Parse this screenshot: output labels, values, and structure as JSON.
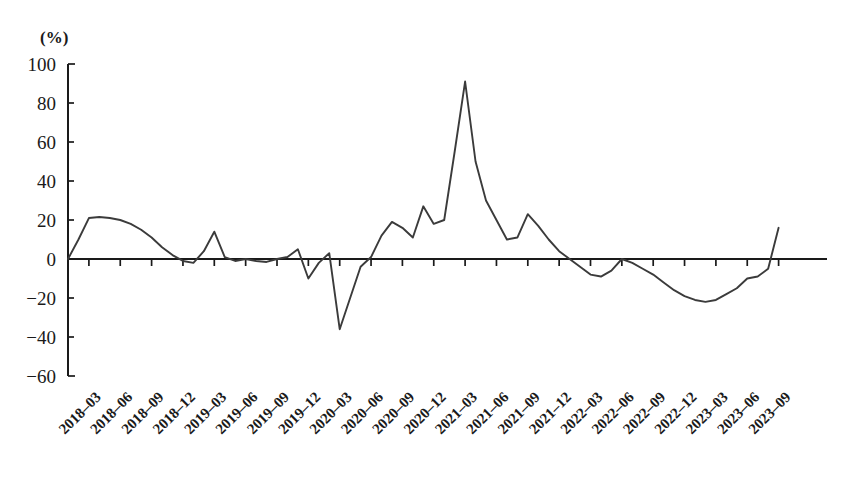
{
  "chart_data": {
    "type": "line",
    "title": "",
    "subtitle": "",
    "xlabel": "",
    "ylabel": "",
    "unit_label": "(%)",
    "ylim": [
      -60,
      100
    ],
    "ytick_values": [
      100,
      80,
      60,
      40,
      20,
      0,
      -20,
      -40,
      -60
    ],
    "ytick_labels": [
      "100",
      "80",
      "60",
      "40",
      "20",
      "0",
      "−20",
      "−40",
      "−60"
    ],
    "grid": false,
    "legend": "none",
    "xtick_labels": [
      "2018–03",
      "2018–06",
      "2018–09",
      "2018–12",
      "2019–03",
      "2019–06",
      "2019–09",
      "2019–12",
      "2020–03",
      "2020–06",
      "2020–09",
      "2020–12",
      "2021–03",
      "2021–06",
      "2021–09",
      "2021–12",
      "2022–03",
      "2022–06",
      "2022–09",
      "2022–12",
      "2023–03",
      "2023–06",
      "2023–09"
    ],
    "x": [
      "2018-01",
      "2018-02",
      "2018-03",
      "2018-04",
      "2018-05",
      "2018-06",
      "2018-07",
      "2018-08",
      "2018-09",
      "2018-10",
      "2018-11",
      "2018-12",
      "2019-01",
      "2019-02",
      "2019-03",
      "2019-04",
      "2019-05",
      "2019-06",
      "2019-07",
      "2019-08",
      "2019-09",
      "2019-10",
      "2019-11",
      "2019-12",
      "2020-01",
      "2020-02",
      "2020-03",
      "2020-04",
      "2020-05",
      "2020-06",
      "2020-07",
      "2020-08",
      "2020-09",
      "2020-10",
      "2020-11",
      "2020-12",
      "2021-01",
      "2021-02",
      "2021-03",
      "2021-04",
      "2021-05",
      "2021-06",
      "2021-07",
      "2021-08",
      "2021-09",
      "2021-10",
      "2021-11",
      "2021-12",
      "2022-01",
      "2022-02",
      "2022-03",
      "2022-04",
      "2022-05",
      "2022-06",
      "2022-07",
      "2022-08",
      "2022-09",
      "2022-10",
      "2022-11",
      "2022-12",
      "2023-01",
      "2023-02",
      "2023-03",
      "2023-04",
      "2023-05",
      "2023-06",
      "2023-07",
      "2023-08",
      "2023-09"
    ],
    "values": [
      0,
      10,
      21,
      21.5,
      21,
      20,
      18,
      15,
      11,
      6,
      2,
      -1,
      -2,
      4,
      14,
      1,
      -1,
      0,
      -1,
      -1.5,
      0,
      1,
      5,
      -10,
      -2,
      3,
      -36,
      -20,
      -4,
      1,
      12,
      19,
      16,
      11,
      27,
      18,
      20,
      55,
      91,
      50,
      30,
      20,
      10,
      11,
      23,
      17,
      10,
      4,
      0,
      -4,
      -8,
      -9,
      -6,
      0,
      -2,
      -5,
      -8,
      -12,
      -16,
      -19,
      -21,
      -22,
      -21,
      -18,
      -15,
      -10,
      -9,
      -5,
      16
    ]
  },
  "axis": {
    "unit": "(%)"
  }
}
